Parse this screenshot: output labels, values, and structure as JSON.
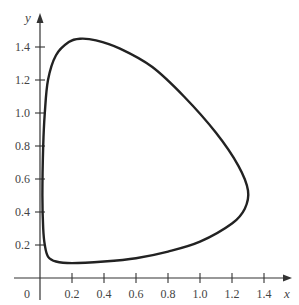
{
  "chart_data": {
    "type": "line",
    "title": "",
    "xlabel": "x",
    "ylabel": "y",
    "xlim": [
      0,
      1.5
    ],
    "ylim": [
      0,
      1.55
    ],
    "grid": false,
    "legend": null,
    "origin_label": "0",
    "x_ticks": [
      "0.2",
      "0.4",
      "0.6",
      "0.8",
      "1.0",
      "1.2",
      "1.4"
    ],
    "y_ticks": [
      "0.2",
      "0.4",
      "0.6",
      "0.8",
      "1.0",
      "1.2",
      "1.4"
    ],
    "series": [
      {
        "name": "closed orbit",
        "closed": true,
        "points": [
          [
            0.02,
            0.8
          ],
          [
            0.03,
            1.0
          ],
          [
            0.05,
            1.2
          ],
          [
            0.1,
            1.35
          ],
          [
            0.18,
            1.43
          ],
          [
            0.25,
            1.45
          ],
          [
            0.35,
            1.44
          ],
          [
            0.5,
            1.39
          ],
          [
            0.7,
            1.28
          ],
          [
            0.9,
            1.1
          ],
          [
            1.1,
            0.88
          ],
          [
            1.24,
            0.68
          ],
          [
            1.3,
            0.53
          ],
          [
            1.28,
            0.42
          ],
          [
            1.2,
            0.33
          ],
          [
            1.0,
            0.22
          ],
          [
            0.8,
            0.16
          ],
          [
            0.6,
            0.12
          ],
          [
            0.4,
            0.1
          ],
          [
            0.2,
            0.09
          ],
          [
            0.1,
            0.1
          ],
          [
            0.05,
            0.13
          ],
          [
            0.03,
            0.2
          ],
          [
            0.02,
            0.3
          ],
          [
            0.015,
            0.5
          ],
          [
            0.02,
            0.8
          ]
        ]
      }
    ]
  }
}
